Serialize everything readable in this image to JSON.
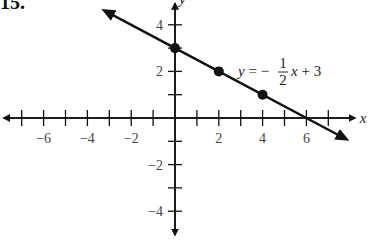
{
  "problem": {
    "number": "15."
  },
  "chart_data": {
    "type": "line",
    "title": "",
    "xlabel": "x",
    "ylabel": "y",
    "xlim": [
      -7.8,
      8
    ],
    "ylim": [
      -5,
      5
    ],
    "grid": false,
    "x_ticks": [
      -7,
      -6,
      -5,
      -4,
      -3,
      -2,
      -1,
      1,
      2,
      3,
      4,
      5,
      6,
      7
    ],
    "x_tick_labels": {
      "-6": "−6",
      "-4": "−4",
      "-2": "−2",
      "2": "2",
      "4": "4",
      "6": "6"
    },
    "y_ticks": [
      -4,
      -3,
      -2,
      -1,
      1,
      2,
      3,
      4
    ],
    "y_tick_labels": {
      "4": "4",
      "2": "2",
      "-2": "−2",
      "-4": "−4"
    },
    "series": [
      {
        "name": "y = -1/2 x + 3",
        "equation": {
          "slope": -0.5,
          "intercept": 3
        },
        "line_extent_x": [
          -3.2,
          7.8
        ],
        "points": [
          {
            "x": 0,
            "y": 3
          },
          {
            "x": 2,
            "y": 2
          },
          {
            "x": 4,
            "y": 1
          }
        ]
      }
    ],
    "annotations": [
      {
        "text_prefix": "y = −",
        "frac_num": "1",
        "frac_den": "2",
        "text_suffix": "x + 3",
        "x": 3,
        "y": 2
      }
    ]
  }
}
